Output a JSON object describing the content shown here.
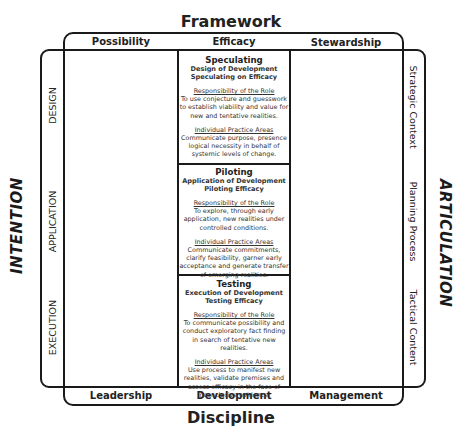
{
  "top": {
    "title": "Framework",
    "columns": [
      "Possibility",
      "Efficacy",
      "Stewardship"
    ]
  },
  "bottom": {
    "title": "Discipline",
    "columns": [
      "Leadership",
      "Development",
      "Management"
    ]
  },
  "left": {
    "title": "INTENTION",
    "rows": [
      "DESIGN",
      "APPLICATION",
      "EXECUTION"
    ]
  },
  "right": {
    "title": "ARTICULATION",
    "rows": [
      "Strategic Context",
      "Planning Process",
      "Tactical Content"
    ]
  },
  "cells": [
    {
      "title": "Speculating",
      "subtitle1": "Design of Development",
      "subtitle2": "Speculating on Efficacy",
      "role_heading": "Responsibility of the Role",
      "role_text": "To use conjecture and guesswork to establish viability and value for new and tentative realities.",
      "practice_heading": "Individual Practice Areas",
      "practice_text": "Communicate purpose, presence logical necessity in behalf of systemic levels of change."
    },
    {
      "title": "Piloting",
      "subtitle1": "Application of Development",
      "subtitle2": "Piloting Efficacy",
      "role_heading": "Responsibility of the Role",
      "role_text": "To explore, through early application, new realities under controlled conditions.",
      "practice_heading": "Individual Practice Areas",
      "practice_text": "Communicate commitments, clarify feasibility, garner early acceptance and generate transfer of emerging realities."
    },
    {
      "title": "Testing",
      "subtitle1": "Execution of Development",
      "subtitle2": "Testing Efficacy",
      "role_heading": "Responsibility of the Role",
      "role_text": "To communicate possibility and conduct exploratory fact finding in search of tentative new realities.",
      "practice_heading": "Individual Practice Areas",
      "practice_text": "Use process to manifest new realities, validate premises and assess efficacy in the face of inconclusive evidence."
    }
  ]
}
